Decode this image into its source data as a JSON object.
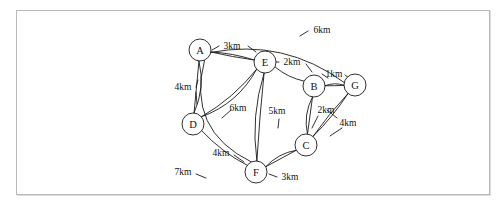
{
  "figure": {
    "kind": "weighted-undirected-graph",
    "title": "",
    "frame": {
      "stroke": "#b9b9b9",
      "fill": "#ffffff"
    },
    "ink_color": "#1a1a1a"
  },
  "chart_data": {
    "type": "diagram",
    "title": "",
    "nodes": [
      {
        "id": "A",
        "label": "A",
        "x": 200,
        "y": 50,
        "r": 11
      },
      {
        "id": "E",
        "label": "E",
        "x": 265,
        "y": 62,
        "r": 11
      },
      {
        "id": "B",
        "label": "B",
        "x": 314,
        "y": 86,
        "r": 11
      },
      {
        "id": "G",
        "label": "G",
        "x": 355,
        "y": 85,
        "r": 11
      },
      {
        "id": "D",
        "label": "D",
        "x": 193,
        "y": 124,
        "r": 11
      },
      {
        "id": "C",
        "label": "C",
        "x": 306,
        "y": 145,
        "r": 11
      },
      {
        "id": "F",
        "label": "F",
        "x": 256,
        "y": 172,
        "r": 11
      }
    ],
    "edges": [
      {
        "from": "A",
        "to": "E",
        "weight": 3,
        "label": "3km",
        "label_x": 232,
        "label_y": 46
      },
      {
        "from": "E",
        "to": "B",
        "weight": 2,
        "label": "2km",
        "label_x": 292,
        "label_y": 62
      },
      {
        "from": "B",
        "to": "G",
        "weight": 1,
        "label": "1km",
        "label_x": 334,
        "label_y": 74
      },
      {
        "from": "A",
        "to": "G",
        "weight": 6,
        "label": "6km",
        "label_x": 322,
        "label_y": 30
      },
      {
        "from": "A",
        "to": "D",
        "weight": 4,
        "label": "4km",
        "label_x": 183,
        "label_y": 87
      },
      {
        "from": "D",
        "to": "E",
        "weight": 6,
        "label": "6km",
        "label_x": 238,
        "label_y": 108
      },
      {
        "from": "E",
        "to": "F",
        "weight": 5,
        "label": "5km",
        "label_x": 277,
        "label_y": 111
      },
      {
        "from": "B",
        "to": "C",
        "weight": 2,
        "label": "2km",
        "label_x": 326,
        "label_y": 110
      },
      {
        "from": "C",
        "to": "G",
        "weight": 4,
        "label": "4km",
        "label_x": 348,
        "label_y": 123
      },
      {
        "from": "D",
        "to": "F",
        "weight": 4,
        "label": "4km",
        "label_x": 221,
        "label_y": 153
      },
      {
        "from": "C",
        "to": "F",
        "weight": 3,
        "label": "3km",
        "label_x": 290,
        "label_y": 177
      },
      {
        "from": "A",
        "to": "F",
        "weight": 7,
        "label": "7km",
        "label_x": 183,
        "label_y": 172
      }
    ],
    "units": "km",
    "node_labels": [
      "A",
      "B",
      "C",
      "D",
      "E",
      "F",
      "G"
    ],
    "edge_labels": [
      "3km",
      "2km",
      "1km",
      "6km",
      "4km",
      "6km",
      "5km",
      "2km",
      "4km",
      "4km",
      "3km",
      "7km"
    ]
  }
}
